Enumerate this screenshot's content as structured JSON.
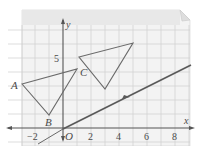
{
  "diagram": {
    "type": "coordinate-grid-translation",
    "axes": {
      "x_label": "x",
      "y_label": "y",
      "origin_label": "O",
      "x_ticks": [
        "−2",
        "2",
        "4",
        "6",
        "8"
      ],
      "y_ticks": [
        "5"
      ]
    },
    "triangle_original": {
      "vertices": [
        {
          "label": "A",
          "x": -3,
          "y": 3
        },
        {
          "label": "B",
          "x": -1,
          "y": 1
        },
        {
          "label": "C",
          "x": 1,
          "y": 4
        }
      ]
    },
    "triangle_image": {
      "vertices": [
        {
          "label": "",
          "x": 1,
          "y": 5
        },
        {
          "label": "",
          "x": 5,
          "y": 6
        },
        {
          "label": "",
          "x": 3,
          "y": 3
        }
      ]
    },
    "vector_line": {
      "from": {
        "x": -2,
        "y": -1
      },
      "to": {
        "x": 9,
        "y": 4.6
      },
      "arrow": true
    },
    "colors": {
      "grid_line": "#cfcfcf",
      "paper": "#f2f2f2",
      "paper_top_band": "#e6e6e6",
      "stroke": "#666666",
      "axis": "#555555",
      "text": "#4a4a4a"
    }
  }
}
